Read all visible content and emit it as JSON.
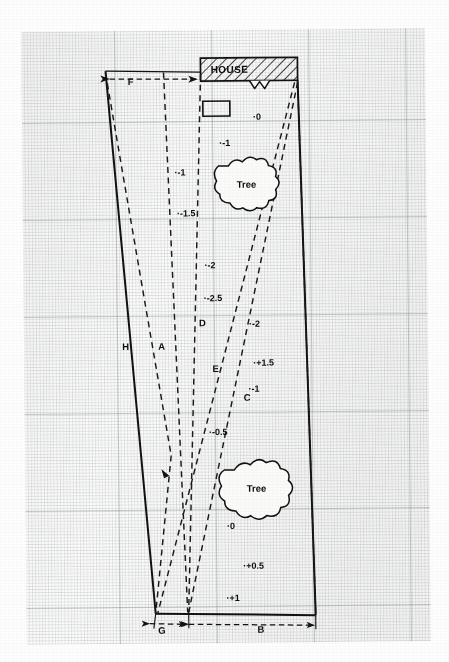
{
  "figure": {
    "type": "survey-plot-diagram",
    "media": "graph-paper",
    "house_label": "HOUSE",
    "tree_label_upper": "Tree",
    "tree_label_lower": "Tree"
  },
  "dimension_labels": [
    {
      "id": "F",
      "label": "F",
      "x": 133,
      "y": 84,
      "orientation": "horizontal-top"
    },
    {
      "id": "G",
      "label": "G",
      "x": 159,
      "y": 629,
      "orientation": "horizontal-bottom"
    },
    {
      "id": "B",
      "label": "B",
      "x": 258,
      "y": 629,
      "orientation": "horizontal-bottom"
    }
  ],
  "point_labels": [
    {
      "id": "H",
      "label": "H",
      "x": 122,
      "y": 349
    },
    {
      "id": "A",
      "label": "A",
      "x": 158,
      "y": 349
    },
    {
      "id": "D",
      "label": "D",
      "x": 199,
      "y": 326
    },
    {
      "id": "E",
      "label": "E",
      "x": 212,
      "y": 372
    },
    {
      "id": "C",
      "label": "C",
      "x": 243,
      "y": 401
    }
  ],
  "elevation_labels": [
    {
      "value": "0",
      "text": "·0",
      "x": 255,
      "y": 120
    },
    {
      "value": "-1",
      "text": "·-1",
      "x": 221,
      "y": 146
    },
    {
      "value": "-1",
      "text": "·-1",
      "x": 176,
      "y": 175
    },
    {
      "value": "-1.5",
      "text": "·-1.5",
      "x": 178,
      "y": 216
    },
    {
      "value": "-2",
      "text": "·-2",
      "x": 205,
      "y": 268
    },
    {
      "value": "-2.5",
      "text": "·-2.5",
      "x": 204,
      "y": 301
    },
    {
      "value": "-2",
      "text": "·-2",
      "x": 249,
      "y": 327
    },
    {
      "value": "+1.5",
      "text": "·+1.5",
      "x": 253,
      "y": 366
    },
    {
      "value": "-1",
      "text": "·-1",
      "x": 248,
      "y": 392
    },
    {
      "value": "-0.5",
      "text": "·-0.5",
      "x": 208,
      "y": 435
    },
    {
      "value": "0",
      "text": "·0",
      "x": 225,
      "y": 529
    },
    {
      "value": "+0.5",
      "text": "·+0.5",
      "x": 241,
      "y": 569
    },
    {
      "value": "+1",
      "text": "·+1",
      "x": 224,
      "y": 601
    }
  ],
  "boundary": {
    "top_left": {
      "x": 108,
      "y": 70
    },
    "top_right": {
      "x": 300,
      "y": 81
    },
    "bottom_right": {
      "x": 313,
      "y": 616
    },
    "bottom_left": {
      "x": 153,
      "y": 613
    }
  },
  "house": {
    "left": 203,
    "right": 300,
    "top": 58,
    "bottom": 81,
    "hatch": "diagonal"
  },
  "colors": {
    "ink": "#111111",
    "paper": "#fbfbfa",
    "grid_minor": "#9aa2a8",
    "grid_major": "#788086"
  }
}
